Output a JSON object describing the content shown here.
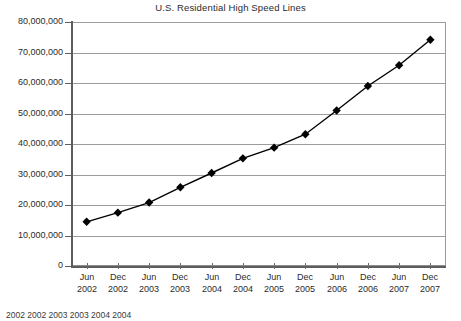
{
  "chart_data": {
    "type": "line",
    "title": "U.S. Residential High Speed Lines",
    "xlabel": "",
    "ylabel": "",
    "ylim": [
      0,
      80000000
    ],
    "ytick_step": 10000000,
    "grid": true,
    "legend": "none",
    "marker": "diamond",
    "line_color": "#000000",
    "marker_color": "#000000",
    "grid_color": "#9c9c9c",
    "categories": [
      "Jun 2002",
      "Dec 2002",
      "Jun 2003",
      "Dec 2003",
      "Jun 2004",
      "Dec 2004",
      "Jun 2005",
      "Dec 2005",
      "Jun 2006",
      "Dec 2006",
      "Jun 2007",
      "Dec 2007"
    ],
    "category_months": [
      "Jun",
      "Dec",
      "Jun",
      "Dec",
      "Jun",
      "Dec",
      "Jun",
      "Dec",
      "Jun",
      "Dec",
      "Jun",
      "Dec"
    ],
    "category_years": [
      "2002",
      "2002",
      "2003",
      "2003",
      "2004",
      "2004",
      "2005",
      "2005",
      "2006",
      "2006",
      "2007",
      "2007"
    ],
    "values": [
      14500000,
      17500000,
      20800000,
      25800000,
      30500000,
      35300000,
      38800000,
      43200000,
      51000000,
      59000000,
      65800000,
      74200000
    ],
    "ytick_labels": [
      "80,000,000",
      "70,000,000",
      "60,000,000",
      "50,000,000",
      "40,000,000",
      "30,000,000",
      "20,000,000",
      "10,000,000",
      "0"
    ],
    "ytick_values": [
      80000000,
      70000000,
      60000000,
      50000000,
      40000000,
      30000000,
      20000000,
      10000000,
      0
    ]
  },
  "caption": "2002 2002 2003 2003 2004 2004"
}
